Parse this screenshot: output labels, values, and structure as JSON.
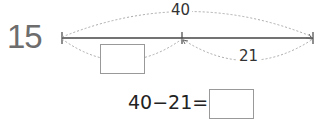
{
  "problem": {
    "number": "15",
    "total_label": "40",
    "known_part_label": "21",
    "unknown_part_label": "",
    "equation": {
      "expression": "40−21=",
      "answer": ""
    }
  },
  "colors": {
    "problem_number": "#6d6d6d",
    "line": "#444444",
    "dotted_arc": "#aaaaaa",
    "box_border": "#999999"
  }
}
